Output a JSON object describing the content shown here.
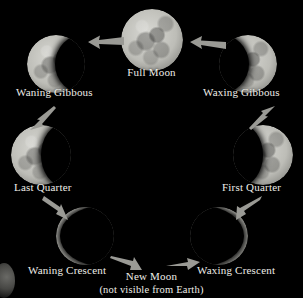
{
  "diagram": {
    "background_color": "#000000",
    "label_color": "#efeee9",
    "moon_light_color": "#c9c9c3",
    "moon_shadow_color": "#000000",
    "cycle_direction": "counterclockwise"
  },
  "phases": [
    {
      "id": "full-moon",
      "label": "Full Moon",
      "illumination_percent": 100,
      "lit_side": "full",
      "center": {
        "x": 152,
        "y": 40
      },
      "radius": 31,
      "label_pos": {
        "x": 152,
        "y": 72
      }
    },
    {
      "id": "waning-gibbous",
      "label": "Waning Gibbous",
      "illumination_percent": 78,
      "lit_side": "left",
      "center": {
        "x": 56,
        "y": 64
      },
      "radius": 29,
      "label_pos": {
        "x": 66,
        "y": 92
      }
    },
    {
      "id": "waxing-gibbous",
      "label": "Waxing Gibbous",
      "illumination_percent": 78,
      "lit_side": "right",
      "center": {
        "x": 248,
        "y": 64
      },
      "radius": 29,
      "label_pos": {
        "x": 239,
        "y": 92
      }
    },
    {
      "id": "last-quarter",
      "label": "Last Quarter",
      "illumination_percent": 50,
      "lit_side": "left",
      "center": {
        "x": 41,
        "y": 155
      },
      "radius": 30,
      "label_pos": {
        "x": 48,
        "y": 186
      }
    },
    {
      "id": "first-quarter",
      "label": "First Quarter",
      "illumination_percent": 50,
      "lit_side": "right",
      "center": {
        "x": 263,
        "y": 155
      },
      "radius": 30,
      "label_pos": {
        "x": 256,
        "y": 186
      }
    },
    {
      "id": "waning-crescent",
      "label": "Waning Crescent",
      "illumination_percent": 12,
      "lit_side": "left",
      "center": {
        "x": 85,
        "y": 236
      },
      "radius": 29,
      "label_pos": {
        "x": 85,
        "y": 270
      }
    },
    {
      "id": "waxing-crescent",
      "label": "Waxing Crescent",
      "illumination_percent": 12,
      "lit_side": "right",
      "center": {
        "x": 219,
        "y": 236
      },
      "radius": 29,
      "label_pos": {
        "x": 219,
        "y": 270
      }
    },
    {
      "id": "new-moon",
      "label": "New Moon",
      "sublabel": "(not visible from Earth)",
      "illumination_percent": 0,
      "lit_side": "none",
      "center": {
        "x": 152,
        "y": 250
      },
      "radius": 0,
      "label_pos": {
        "x": 152,
        "y": 277
      },
      "sublabel_pos": {
        "x": 152,
        "y": 290
      }
    }
  ],
  "arrows": [
    {
      "id": "arrow-full-to-waning-gibbous",
      "from": "full-moon",
      "to": "waning-gibbous",
      "direction": "left"
    },
    {
      "id": "arrow-waxing-gibbous-to-full",
      "from": "waxing-gibbous",
      "to": "full-moon",
      "direction": "left"
    },
    {
      "id": "arrow-waning-gibbous-to-last-quarter",
      "from": "waning-gibbous",
      "to": "last-quarter",
      "direction": "down-left"
    },
    {
      "id": "arrow-first-quarter-to-waxing-gibbous",
      "from": "first-quarter",
      "to": "waxing-gibbous",
      "direction": "up-right"
    },
    {
      "id": "arrow-last-quarter-to-waning-crescent",
      "from": "last-quarter",
      "to": "waning-crescent",
      "direction": "down-right"
    },
    {
      "id": "arrow-waxing-crescent-to-first-quarter",
      "from": "waxing-crescent",
      "to": "first-quarter",
      "direction": "up-right"
    },
    {
      "id": "arrow-waning-crescent-to-new-moon",
      "from": "waning-crescent",
      "to": "new-moon",
      "direction": "right-down"
    },
    {
      "id": "arrow-new-moon-to-waxing-crescent",
      "from": "new-moon",
      "to": "waxing-crescent",
      "direction": "right"
    }
  ]
}
